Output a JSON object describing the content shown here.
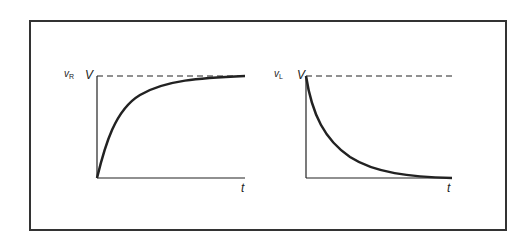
{
  "diagrams": [
    {
      "name": "resistor-voltage",
      "y_label": "v",
      "y_label_sub": "R",
      "level_label": "V",
      "x_label": "t",
      "curve": "rising exponential approaching V"
    },
    {
      "name": "inductor-voltage",
      "y_label": "v",
      "y_label_sub": "L",
      "level_label": "V",
      "x_label": "t",
      "curve": "decaying exponential from V to 0"
    }
  ],
  "colors": {
    "line": "#222222",
    "frame": "#333333",
    "background": "#ffffff"
  }
}
